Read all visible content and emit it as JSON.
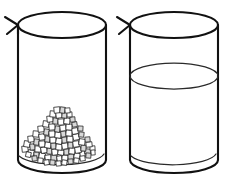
{
  "illustration": {
    "title": "Two beakers line drawing",
    "background_color": "#ffffff",
    "line_color": "#111111",
    "vessels": [
      {
        "id": "left-beaker",
        "label": "Beaker with granular solid",
        "contents_type": "granular solid",
        "contents_label": "pile of granules",
        "granule_count": 170,
        "fill_description": "low heaped pile resting on the base",
        "has_pour_spout": true,
        "spout_side": "left",
        "geometry": {
          "left_wall_x": 18,
          "right_wall_x": 106,
          "rim_center_y": 25,
          "rim_rx": 44,
          "rim_ry": 13,
          "base_center_y": 160,
          "base_rx": 44,
          "base_ry": 13,
          "pile_peak_y": 107,
          "pile_base_y": 166
        }
      },
      {
        "id": "right-beaker",
        "label": "Beaker with liquid",
        "contents_type": "liquid",
        "contents_label": "clear liquid",
        "liquid_level_y": 76,
        "fill_description": "liquid filled to slightly above middle",
        "has_pour_spout": true,
        "spout_side": "left",
        "geometry": {
          "left_wall_x": 130,
          "right_wall_x": 218,
          "rim_center_y": 25,
          "rim_rx": 44,
          "rim_ry": 13,
          "base_center_y": 160,
          "base_rx": 44,
          "base_ry": 13,
          "surface_rx": 44,
          "surface_ry": 13
        }
      }
    ]
  }
}
